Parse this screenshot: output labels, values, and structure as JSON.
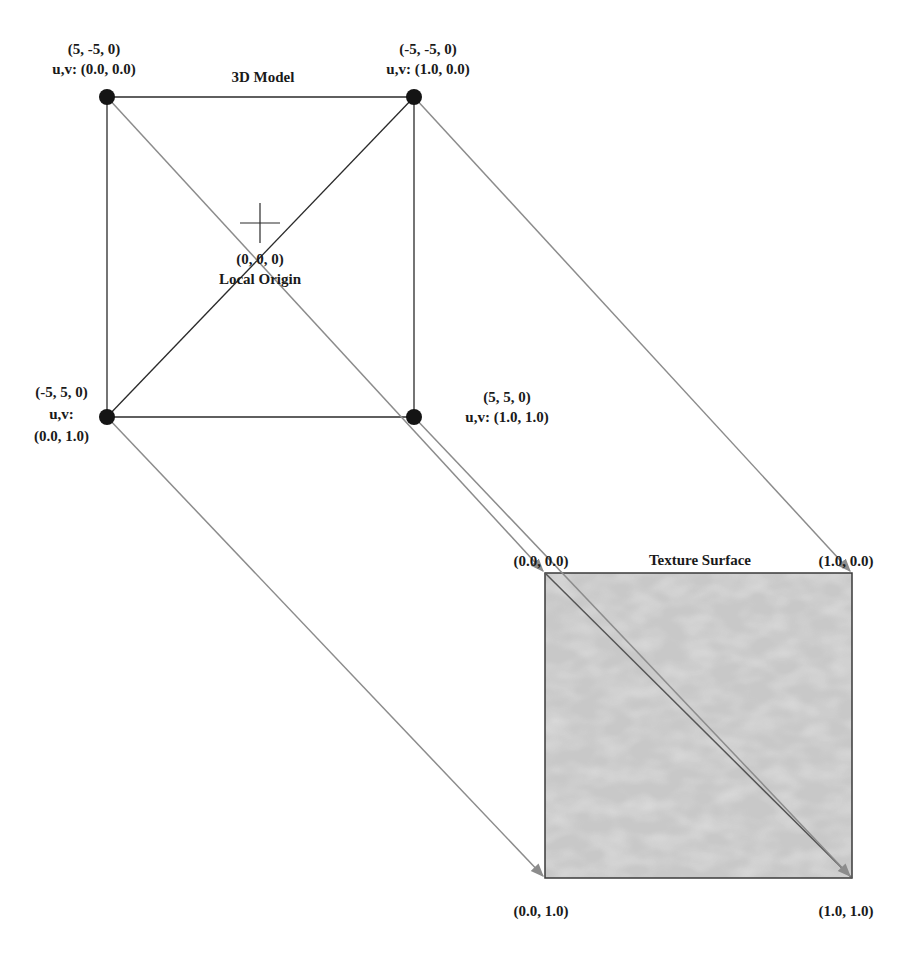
{
  "model": {
    "title": "3D Model",
    "origin": {
      "coord": "(0, 0, 0)",
      "label": "Local Origin"
    },
    "vertices": [
      {
        "id": "top-left",
        "position": "(5, -5, 0)",
        "uv_prefix": "u,v:",
        "uv": "(0.0, 0.0)",
        "uv_line": "u,v: (0.0, 0.0)"
      },
      {
        "id": "top-right",
        "position": "(-5, -5, 0)",
        "uv_prefix": "u,v:",
        "uv": "(1.0, 0.0)",
        "uv_line": "u,v: (1.0, 0.0)"
      },
      {
        "id": "bottom-left",
        "position": "(-5, 5, 0)",
        "uv_prefix": "u,v:",
        "uv": "(0.0, 1.0)",
        "uv_line": "u,v:"
      },
      {
        "id": "bottom-right",
        "position": "(5, 5, 0)",
        "uv_prefix": "u,v:",
        "uv": "(1.0, 1.0)",
        "uv_line": "u,v: (1.0, 1.0)"
      }
    ]
  },
  "texture": {
    "title": "Texture Surface",
    "corners": {
      "top_left": "(0.0, 0.0)",
      "top_right": "(1.0, 0.0)",
      "bottom_left": "(0.0, 1.0)",
      "bottom_right": "(1.0, 1.0)"
    }
  },
  "colors": {
    "model_edge": "#2a2a2a",
    "vertex": "#141414",
    "mapping_arrow": "#8c8c8c",
    "texture_fill": "#c4c4c4",
    "texture_border": "#3a3a3a",
    "text": "#1a1a1a"
  }
}
